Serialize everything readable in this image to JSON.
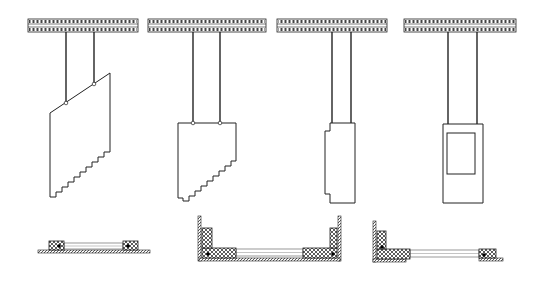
{
  "diagram": {
    "width": 541,
    "height": 285,
    "stroke_color": "#222222",
    "hatch_color": "#333333",
    "background": "#ffffff",
    "rails": [
      {
        "x": 28,
        "y": 19,
        "w": 110,
        "h": 13
      },
      {
        "x": 148,
        "y": 19,
        "w": 118,
        "h": 13
      },
      {
        "x": 277,
        "y": 19,
        "w": 110,
        "h": 13
      },
      {
        "x": 404,
        "y": 19,
        "w": 112,
        "h": 13
      }
    ],
    "panels": [
      {
        "name": "stair-panel-slanted",
        "hangers": [
          [
            66,
            32,
            66,
            103
          ],
          [
            94,
            32,
            94,
            84
          ]
        ],
        "joints": [
          [
            66,
            103
          ],
          [
            94,
            84
          ]
        ],
        "outline": [
          [
            50,
            113
          ],
          [
            110,
            73
          ],
          [
            110,
            152
          ],
          [
            104,
            152
          ],
          [
            104,
            157
          ],
          [
            98,
            157
          ],
          [
            98,
            162
          ],
          [
            92,
            162
          ],
          [
            92,
            167
          ],
          [
            86,
            167
          ],
          [
            86,
            172
          ],
          [
            80,
            172
          ],
          [
            80,
            177
          ],
          [
            74,
            177
          ],
          [
            74,
            182
          ],
          [
            68,
            182
          ],
          [
            68,
            187
          ],
          [
            62,
            187
          ],
          [
            62,
            192
          ],
          [
            56,
            192
          ],
          [
            56,
            197
          ],
          [
            50,
            197
          ]
        ]
      },
      {
        "name": "stair-panel-flat-top",
        "hangers": [
          [
            193,
            32,
            193,
            123
          ],
          [
            220,
            32,
            220,
            123
          ]
        ],
        "joints": [
          [
            193,
            123
          ],
          [
            220,
            123
          ]
        ],
        "outline": [
          [
            178,
            123
          ],
          [
            236,
            123
          ],
          [
            236,
            161
          ],
          [
            231,
            161
          ],
          [
            231,
            166
          ],
          [
            225,
            166
          ],
          [
            225,
            171
          ],
          [
            219,
            171
          ],
          [
            219,
            176
          ],
          [
            213,
            176
          ],
          [
            213,
            181
          ],
          [
            207,
            181
          ],
          [
            207,
            186
          ],
          [
            201,
            186
          ],
          [
            201,
            191
          ],
          [
            195,
            191
          ],
          [
            195,
            196
          ],
          [
            189,
            196
          ],
          [
            189,
            201
          ],
          [
            183,
            201
          ],
          [
            183,
            198
          ],
          [
            178,
            198
          ]
        ]
      },
      {
        "name": "narrow-door-panel",
        "hangers": [
          [
            332,
            32,
            332,
            123
          ],
          [
            351,
            32,
            351,
            123
          ]
        ],
        "joints": [],
        "outline": [
          [
            330,
            123
          ],
          [
            355,
            123
          ],
          [
            355,
            203
          ],
          [
            330,
            203
          ],
          [
            330,
            194
          ],
          [
            325,
            194
          ],
          [
            325,
            131
          ],
          [
            330,
            131
          ]
        ]
      },
      {
        "name": "glazed-door-panel",
        "hangers": [
          [
            448,
            32,
            448,
            124
          ],
          [
            477,
            32,
            477,
            124
          ]
        ],
        "joints": [],
        "outline": [
          [
            443,
            124
          ],
          [
            483,
            124
          ],
          [
            483,
            203
          ],
          [
            443,
            203
          ]
        ],
        "inner_window": {
          "x": 447,
          "y": 133,
          "w": 28,
          "h": 41
        }
      }
    ],
    "sections": [
      {
        "name": "section-straight",
        "base": {
          "x": 38,
          "y": 250,
          "w": 112,
          "h": 3
        },
        "glass": {
          "x": 64,
          "y": 243,
          "w": 59,
          "h": 6
        },
        "blocks": [
          {
            "x": 49,
            "y": 241,
            "w": 15,
            "h": 9,
            "dot": [
              59,
              246
            ]
          },
          {
            "x": 123,
            "y": 241,
            "w": 15,
            "h": 9,
            "dot": [
              128,
              246
            ]
          }
        ],
        "walls": []
      },
      {
        "name": "section-u-shape",
        "base": {
          "x": 199,
          "y": 258,
          "w": 141,
          "h": 3
        },
        "glass": {
          "x": 236,
          "y": 249,
          "w": 67,
          "h": 7
        },
        "blocks": [
          {
            "x": 202,
            "y": 248,
            "w": 34,
            "h": 10,
            "dot": [
              208,
              254
            ]
          },
          {
            "x": 202,
            "y": 228,
            "w": 10,
            "h": 20,
            "dot": null
          },
          {
            "x": 303,
            "y": 248,
            "w": 34,
            "h": 10,
            "dot": [
              333,
              254
            ]
          },
          {
            "x": 330,
            "y": 228,
            "w": 7,
            "h": 20,
            "dot": null
          }
        ],
        "walls": [
          {
            "x": 198,
            "y": 216,
            "w": 3,
            "h": 45
          },
          {
            "x": 338,
            "y": 216,
            "w": 3,
            "h": 45
          }
        ]
      },
      {
        "name": "section-l-shape",
        "base": {
          "x": 373,
          "y": 259,
          "w": 33,
          "h": 3
        },
        "glass": {
          "x": 410,
          "y": 250,
          "w": 69,
          "h": 7
        },
        "blocks": [
          {
            "x": 377,
            "y": 249,
            "w": 33,
            "h": 10,
            "dot": null
          },
          {
            "x": 377,
            "y": 231,
            "w": 9,
            "h": 18,
            "dot": [
              382,
              247
            ]
          },
          {
            "x": 479,
            "y": 249,
            "w": 17,
            "h": 9,
            "dot": [
              484,
              255
            ]
          }
        ],
        "walls": [
          {
            "x": 373,
            "y": 221,
            "w": 3,
            "h": 41
          }
        ],
        "tail": {
          "x": 479,
          "y": 258,
          "w": 24,
          "h": 3
        }
      }
    ]
  }
}
